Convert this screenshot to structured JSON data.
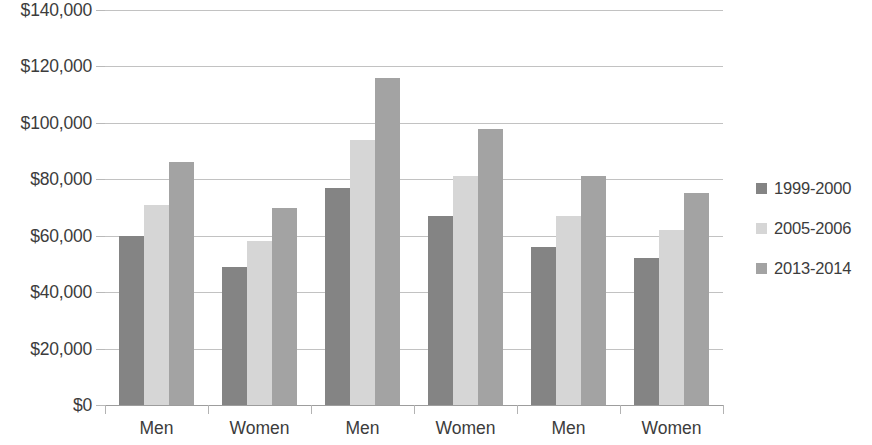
{
  "chart_data": {
    "type": "bar",
    "title": "",
    "xlabel": "",
    "ylabel": "",
    "ylim": [
      0,
      140000
    ],
    "ytick_step": 20000,
    "grid": true,
    "legend_position": "right",
    "categories": [
      "Men",
      "Women",
      "Men",
      "Women",
      "Men",
      "Women"
    ],
    "ytick_labels": [
      "$140,000",
      "$120,000",
      "$100,000",
      "$80,000",
      "$60,000",
      "$40,000",
      "$20,000",
      "$0"
    ],
    "ytick_values": [
      140000,
      120000,
      100000,
      80000,
      60000,
      40000,
      20000,
      0
    ],
    "series": [
      {
        "name": "1999-2000",
        "color": "#848484",
        "values": [
          60000,
          49000,
          77000,
          67000,
          56000,
          52000
        ]
      },
      {
        "name": "2005-2006",
        "color": "#d6d6d6",
        "values": [
          71000,
          58000,
          94000,
          81000,
          67000,
          62000
        ]
      },
      {
        "name": "2013-2014",
        "color": "#a3a3a3",
        "values": [
          86000,
          70000,
          116000,
          98000,
          81000,
          75000
        ]
      }
    ]
  }
}
